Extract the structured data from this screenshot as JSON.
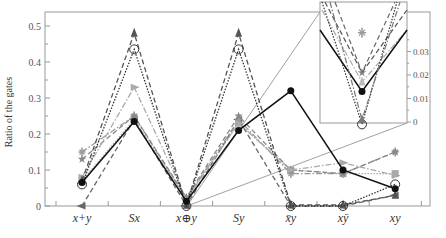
{
  "chart_data": {
    "type": "line",
    "title": "",
    "xlabel": "",
    "ylabel": "Ratio of the gates",
    "categories": [
      "x+y",
      "Sx",
      "x⊕y",
      "Sy",
      "x̄y",
      "xȳ",
      "xy"
    ],
    "ylim": [
      0,
      0.52
    ],
    "yticks": [
      "0",
      "0.1",
      "0.2",
      "0.3",
      "0.4",
      "0.5"
    ],
    "grid": false,
    "legend": "none",
    "series": [
      {
        "name": "solid-black-circle",
        "style": "solid",
        "color": "#111111",
        "marker": "filled-circle",
        "values": [
          0.065,
          0.235,
          0.013,
          0.21,
          0.32,
          0.1,
          0.048
        ]
      },
      {
        "name": "dotted-open-circle",
        "style": "dotted",
        "color": "#333333",
        "marker": "open-circle",
        "values": [
          0.06,
          0.435,
          0.0,
          0.435,
          0.0,
          0.0,
          0.06
        ]
      },
      {
        "name": "dashed-dark-triangle-up",
        "style": "dashed",
        "color": "#555555",
        "marker": "triangle-up",
        "values": [
          0.07,
          0.48,
          0.002,
          0.48,
          0.003,
          0.003,
          0.03
        ]
      },
      {
        "name": "dashdot-light-triangle-right",
        "style": "dashdot",
        "color": "#aaaaaa",
        "marker": "triangle-right",
        "values": [
          0.08,
          0.33,
          0.018,
          0.23,
          0.1,
          0.12,
          0.085
        ]
      },
      {
        "name": "dashed-gray-star",
        "style": "dashed",
        "color": "#888888",
        "marker": "star",
        "values": [
          0.13,
          0.25,
          0.024,
          0.25,
          0.1,
          0.09,
          0.15
        ]
      },
      {
        "name": "dashdot-gray-cross",
        "style": "dashdot",
        "color": "#999999",
        "marker": "cross",
        "values": [
          0.15,
          0.25,
          0.02,
          0.24,
          0.09,
          0.09,
          0.15
        ]
      },
      {
        "name": "dashed-dark-triangle-left",
        "style": "dashed",
        "color": "#666666",
        "marker": "triangle-left",
        "values": [
          0.0,
          0.24,
          0.001,
          0.24,
          0.0,
          0.0,
          0.03
        ]
      },
      {
        "name": "dotted-gray-square",
        "style": "dotted",
        "color": "#aaaaaa",
        "marker": "square",
        "values": [
          0.07,
          0.24,
          0.02,
          0.23,
          0.1,
          0.09,
          0.09
        ]
      }
    ],
    "inset": {
      "target_category": "x⊕y",
      "ylim": [
        -0.003,
        0.04
      ],
      "yticks": [
        "0",
        "0.01",
        "0.02",
        "0.03"
      ],
      "axis_position": "right",
      "points": [
        {
          "series": "dashed-gray-star",
          "value": 0.038
        },
        {
          "series": "dashed-gray-star-2",
          "value": 0.021
        },
        {
          "series": "dashdot-light-triangle-right",
          "value": 0.017
        },
        {
          "series": "solid-black-circle",
          "value": 0.013
        },
        {
          "series": "dashed-dark-triangle-up",
          "value": 0.001
        },
        {
          "series": "dotted-open-circle",
          "value": -0.001
        }
      ]
    }
  }
}
